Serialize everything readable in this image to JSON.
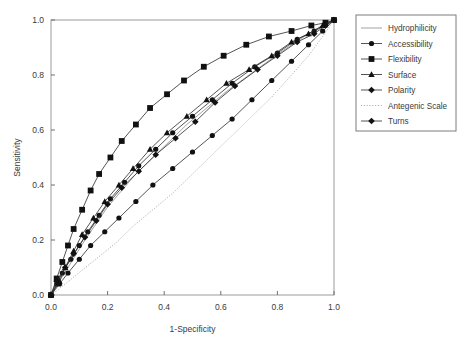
{
  "chart_data": {
    "type": "line",
    "title": "",
    "xlabel": "1-Specificity",
    "ylabel": "Sensitivity",
    "xlim": [
      0.0,
      1.0
    ],
    "ylim": [
      0.0,
      1.0
    ],
    "xticks": [
      "0.0",
      "0.2",
      "0.4",
      "0.6",
      "0.8",
      "1.0"
    ],
    "yticks": [
      "0.0",
      "0.2",
      "0.4",
      "0.6",
      "0.8",
      "1.0"
    ],
    "xtick_values": [
      0.0,
      0.2,
      0.4,
      0.6,
      0.8,
      1.0
    ],
    "ytick_values": [
      0.0,
      0.2,
      0.4,
      0.6,
      0.8,
      1.0
    ],
    "grid": false,
    "legend_position": "right",
    "series": [
      {
        "name": "Hydrophilicity",
        "marker": "none",
        "linestyle": "solid",
        "x": [
          0.0,
          0.03,
          0.06,
          0.09,
          0.12,
          0.16,
          0.2,
          0.25,
          0.3,
          0.36,
          0.42,
          0.48,
          0.55,
          0.62,
          0.7,
          0.78,
          0.85,
          0.91,
          0.96,
          1.0
        ],
        "y": [
          0.0,
          0.05,
          0.1,
          0.15,
          0.2,
          0.26,
          0.32,
          0.38,
          0.44,
          0.5,
          0.56,
          0.62,
          0.68,
          0.74,
          0.8,
          0.86,
          0.91,
          0.95,
          0.98,
          1.0
        ]
      },
      {
        "name": "Accessibility",
        "marker": "circle",
        "linestyle": "solid",
        "x": [
          0.0,
          0.02,
          0.04,
          0.07,
          0.1,
          0.13,
          0.17,
          0.21,
          0.26,
          0.31,
          0.37,
          0.43,
          0.5,
          0.57,
          0.64,
          0.72,
          0.8,
          0.87,
          0.93,
          0.97,
          1.0
        ],
        "y": [
          0.0,
          0.04,
          0.08,
          0.13,
          0.18,
          0.23,
          0.29,
          0.35,
          0.41,
          0.47,
          0.53,
          0.59,
          0.65,
          0.71,
          0.77,
          0.83,
          0.88,
          0.93,
          0.96,
          0.98,
          1.0
        ]
      },
      {
        "name": "Flexibility",
        "marker": "square",
        "linestyle": "solid",
        "x": [
          0.0,
          0.02,
          0.04,
          0.06,
          0.08,
          0.11,
          0.14,
          0.17,
          0.21,
          0.25,
          0.3,
          0.35,
          0.41,
          0.47,
          0.54,
          0.61,
          0.69,
          0.77,
          0.85,
          0.92,
          0.97,
          1.0
        ],
        "y": [
          0.0,
          0.06,
          0.12,
          0.18,
          0.24,
          0.31,
          0.38,
          0.44,
          0.5,
          0.56,
          0.62,
          0.68,
          0.73,
          0.78,
          0.83,
          0.87,
          0.91,
          0.94,
          0.96,
          0.98,
          0.99,
          1.0
        ]
      },
      {
        "name": "Surface",
        "marker": "triangle",
        "linestyle": "solid",
        "x": [
          0.0,
          0.03,
          0.05,
          0.08,
          0.11,
          0.15,
          0.19,
          0.24,
          0.29,
          0.35,
          0.41,
          0.48,
          0.55,
          0.62,
          0.7,
          0.78,
          0.85,
          0.91,
          0.96,
          1.0
        ],
        "y": [
          0.0,
          0.05,
          0.1,
          0.16,
          0.22,
          0.28,
          0.34,
          0.4,
          0.46,
          0.53,
          0.59,
          0.65,
          0.71,
          0.77,
          0.82,
          0.87,
          0.92,
          0.95,
          0.98,
          1.0
        ]
      },
      {
        "name": "Polarity",
        "marker": "diamond",
        "linestyle": "solid",
        "x": [
          0.0,
          0.02,
          0.05,
          0.08,
          0.12,
          0.16,
          0.2,
          0.25,
          0.31,
          0.37,
          0.44,
          0.51,
          0.58,
          0.65,
          0.73,
          0.8,
          0.87,
          0.93,
          0.97,
          1.0
        ],
        "y": [
          0.0,
          0.05,
          0.1,
          0.15,
          0.21,
          0.27,
          0.33,
          0.39,
          0.45,
          0.51,
          0.57,
          0.63,
          0.7,
          0.76,
          0.82,
          0.87,
          0.92,
          0.95,
          0.98,
          1.0
        ]
      },
      {
        "name": "Antegenic Scale",
        "marker": "none",
        "linestyle": "dotted",
        "x": [
          0.0,
          0.05,
          0.11,
          0.17,
          0.23,
          0.29,
          0.36,
          0.43,
          0.5,
          0.57,
          0.64,
          0.71,
          0.78,
          0.85,
          0.91,
          0.96,
          1.0
        ],
        "y": [
          0.0,
          0.04,
          0.09,
          0.14,
          0.19,
          0.25,
          0.31,
          0.37,
          0.44,
          0.51,
          0.58,
          0.65,
          0.72,
          0.8,
          0.87,
          0.94,
          1.0
        ]
      },
      {
        "name": "Turns",
        "marker": "circle",
        "linestyle": "solid",
        "x": [
          0.0,
          0.03,
          0.06,
          0.1,
          0.14,
          0.19,
          0.24,
          0.3,
          0.36,
          0.43,
          0.5,
          0.57,
          0.64,
          0.71,
          0.78,
          0.85,
          0.91,
          0.96,
          1.0
        ],
        "y": [
          0.0,
          0.04,
          0.08,
          0.13,
          0.18,
          0.23,
          0.28,
          0.34,
          0.4,
          0.46,
          0.52,
          0.58,
          0.64,
          0.71,
          0.78,
          0.85,
          0.91,
          0.96,
          1.0
        ]
      }
    ],
    "legend_entries": [
      {
        "label": "Hydrophilicity",
        "marker": "none",
        "linestyle": "solid"
      },
      {
        "label": "Accessibility",
        "marker": "circle",
        "linestyle": "solid"
      },
      {
        "label": "Flexibility",
        "marker": "square",
        "linestyle": "solid"
      },
      {
        "label": "Surface",
        "marker": "triangle",
        "linestyle": "solid"
      },
      {
        "label": "Polarity",
        "marker": "diamond",
        "linestyle": "solid"
      },
      {
        "label": "Antegenic Scale",
        "marker": "none",
        "linestyle": "dotted"
      },
      {
        "label": "Turns",
        "marker": "diamond",
        "linestyle": "solid"
      }
    ],
    "colors": {
      "line": "#2a2a2a",
      "marker": "#111111",
      "frame": "#9a9a9a",
      "text": "#3a3a3a",
      "background": "#ffffff"
    }
  }
}
